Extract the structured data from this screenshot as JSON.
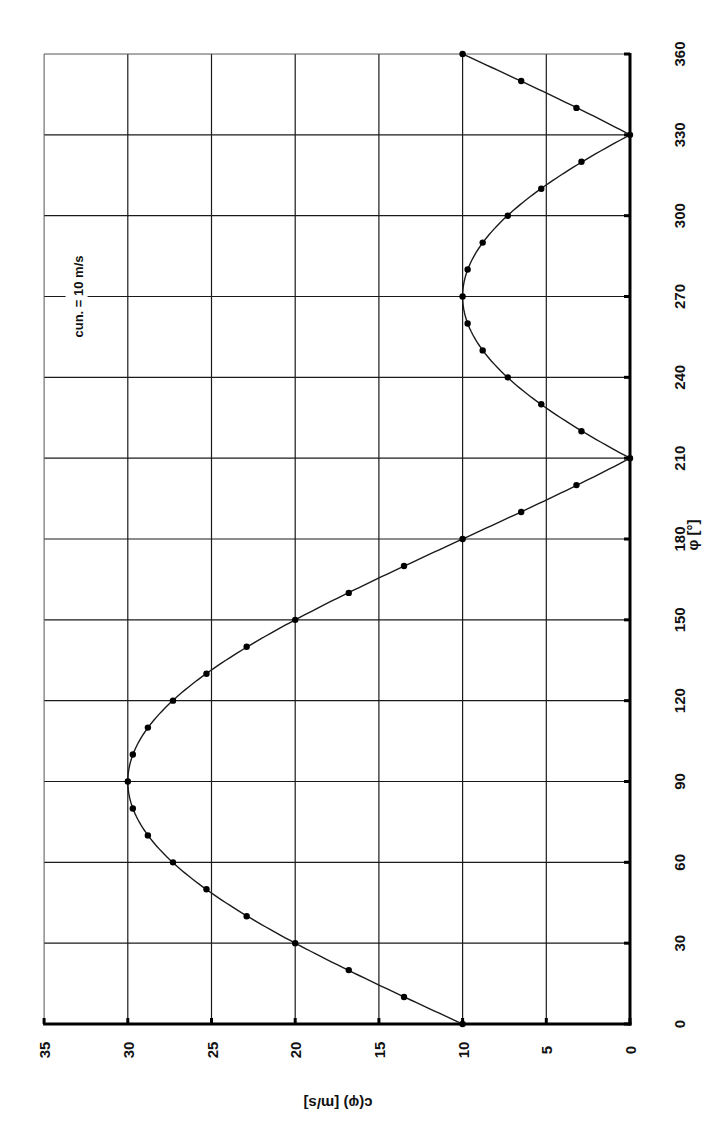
{
  "chart_data": {
    "type": "line",
    "orientation": "rotated-90-ccw",
    "title": "",
    "xlabel": "φ [°]",
    "ylabel": "c(φ) [m/s]",
    "xlim": [
      0,
      360
    ],
    "ylim": [
      0,
      35
    ],
    "x_ticks": [
      0,
      30,
      60,
      90,
      120,
      150,
      180,
      210,
      240,
      270,
      300,
      330,
      360
    ],
    "y_ticks": [
      0,
      5,
      10,
      15,
      20,
      25,
      30,
      35
    ],
    "grid": true,
    "legend": null,
    "annotation": "cun. = 10  m/s",
    "annotation_at": {
      "x": 270,
      "y": 33
    },
    "series": [
      {
        "name": "c(φ) = |cun + 2·cun·sin φ| (curve)",
        "style": "line",
        "x": [
          0,
          10,
          20,
          30,
          40,
          50,
          60,
          70,
          80,
          90,
          100,
          110,
          120,
          130,
          140,
          150,
          160,
          170,
          180,
          190,
          200,
          210,
          220,
          230,
          240,
          250,
          260,
          270,
          280,
          290,
          300,
          310,
          320,
          330,
          340,
          350,
          360
        ],
        "values": [
          10.0,
          13.5,
          16.8,
          20.0,
          22.9,
          25.3,
          27.3,
          28.8,
          29.7,
          30.0,
          29.7,
          28.8,
          27.3,
          25.3,
          22.9,
          20.0,
          16.8,
          13.5,
          10.0,
          6.5,
          3.2,
          0.0,
          2.9,
          5.3,
          7.3,
          8.8,
          9.7,
          10.0,
          9.7,
          8.8,
          7.3,
          5.3,
          2.9,
          0.0,
          3.2,
          6.5,
          10.0
        ]
      },
      {
        "name": "measured points",
        "style": "markers",
        "x": [
          0,
          10,
          20,
          30,
          40,
          50,
          60,
          70,
          80,
          90,
          100,
          110,
          120,
          130,
          140,
          150,
          160,
          170,
          180,
          190,
          200,
          210,
          220,
          230,
          240,
          250,
          260,
          270,
          280,
          290,
          300,
          310,
          320,
          330,
          340,
          350,
          360
        ],
        "values": [
          10.0,
          13.5,
          16.8,
          20.0,
          22.9,
          25.3,
          27.3,
          28.8,
          29.7,
          30.0,
          29.7,
          28.8,
          27.3,
          25.3,
          22.9,
          20.0,
          16.8,
          13.5,
          10.0,
          6.5,
          3.2,
          0.0,
          2.9,
          5.3,
          7.3,
          8.8,
          9.7,
          10.0,
          9.7,
          8.8,
          7.3,
          5.3,
          2.9,
          0.0,
          3.2,
          6.5,
          10.0
        ]
      }
    ]
  },
  "layout": {
    "c_axis_zero_px": 630,
    "c_axis_px_per_unit": 16.74,
    "phi_axis_zero_px": 1024,
    "phi_axis_px_per_deg": 2.6944,
    "frame_top_px": 54,
    "frame_left_px": 44
  },
  "colors": {
    "line": "#1a1a1a",
    "marker": "#000000",
    "grid": "#1a1a1a",
    "background": "#ffffff"
  }
}
